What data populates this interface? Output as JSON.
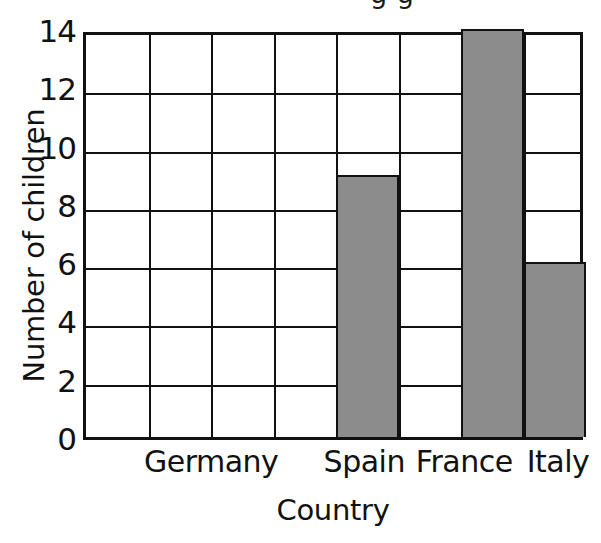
{
  "figure": {
    "cropped_title_fragment": "g g",
    "background_color": "#ffffff"
  },
  "chart_data": {
    "type": "bar",
    "title": "",
    "xlabel": "Country",
    "ylabel": "Number of children",
    "categories": [
      "Germany",
      "Spain",
      "France",
      "Italy"
    ],
    "values": [
      0,
      9,
      14,
      6
    ],
    "ylim": [
      0,
      14
    ],
    "ytick_labels": [
      "0",
      "2",
      "4",
      "6",
      "8",
      "10",
      "12",
      "14"
    ],
    "ytick_values": [
      0,
      2,
      4,
      6,
      8,
      10,
      12,
      14
    ],
    "grid": true,
    "grid_columns": 8,
    "legend": "none",
    "bar_color": "#8c8c8c",
    "line_color": "#111111",
    "bar_slots": [
      {
        "category": "Germany",
        "column": 0,
        "value": 0
      },
      {
        "category": "Spain",
        "column": 4,
        "value": 9
      },
      {
        "category": "France",
        "column": 6,
        "value": 14
      },
      {
        "category": "Italy",
        "column": 7,
        "value": 6
      }
    ],
    "category_label_columns": [
      2.05,
      4.5,
      6.1,
      7.6
    ]
  }
}
